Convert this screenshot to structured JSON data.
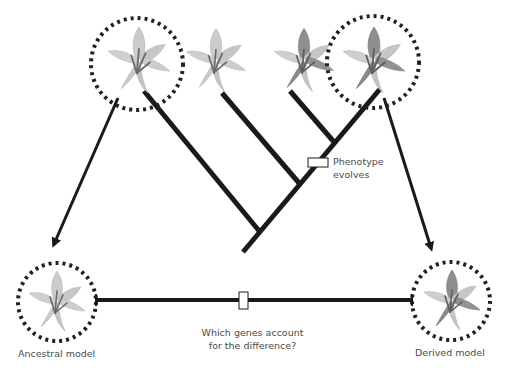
{
  "diagram": {
    "type": "phylogenetic-tree",
    "taxa": [
      {
        "id": "ancestral",
        "phenotype": "ancestral",
        "highlighted": true
      },
      {
        "id": "taxon-2",
        "phenotype": "ancestral",
        "highlighted": false
      },
      {
        "id": "taxon-3",
        "phenotype": "derived",
        "highlighted": false
      },
      {
        "id": "derived",
        "phenotype": "derived",
        "highlighted": true
      }
    ],
    "annotations": {
      "phenotype_label_line1": "Phenotype",
      "phenotype_label_line2": "evolves",
      "question_line1": "Which genes account",
      "question_line2": "for the difference?"
    },
    "models": {
      "ancestral_label": "Ancestral model",
      "derived_label": "Derived model"
    },
    "colors": {
      "line": "#1a1a1a",
      "petal_light": "#c8c8c8",
      "petal_dark": "#8a8a8a",
      "stamen": "#6a6a6a",
      "text": "#4a4a4a"
    }
  }
}
